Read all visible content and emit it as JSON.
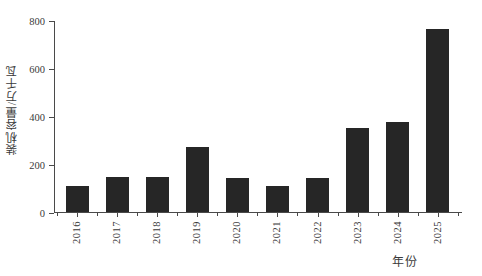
{
  "chart_data": {
    "type": "bar",
    "title": "",
    "xlabel": "年份",
    "ylabel": "装机容量/万千瓦",
    "categories": [
      "2016",
      "2017",
      "2018",
      "2019",
      "2020",
      "2021",
      "2022",
      "2023",
      "2024",
      "2025"
    ],
    "values": [
      110,
      145,
      145,
      272,
      140,
      110,
      140,
      350,
      375,
      762
    ],
    "ylim": [
      0,
      800
    ],
    "yticks": [
      0,
      200,
      400,
      600,
      800
    ],
    "ytick_labels": [
      "0",
      "200",
      "400",
      "600",
      "800"
    ],
    "grid": false,
    "legend": null,
    "series_color": "#262626",
    "axis_color": "#4a4a4a",
    "background": "#ffffff"
  }
}
